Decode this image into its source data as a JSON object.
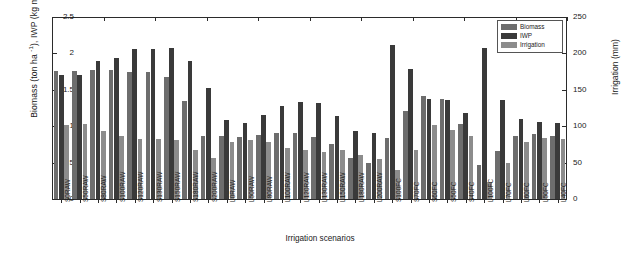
{
  "chart_data": {
    "type": "bar",
    "title": "",
    "xlabel": "Irrigation scenarios",
    "ylabel_left": "Biomass (ton ha -1), IWP (kg m -3)",
    "ylabel_right": "Irrigation (mm)",
    "ylim_left": [
      0,
      2.5
    ],
    "ylim_right": [
      0,
      250
    ],
    "yticks_left": [
      "0",
      "0.5",
      "1",
      "1.5",
      "2",
      "2.5"
    ],
    "yticks_left_values": [
      0,
      0.5,
      1,
      1.5,
      2,
      2.5
    ],
    "yticks_right": [
      "0",
      "50",
      "100",
      "150",
      "200",
      "250"
    ],
    "yticks_right_values": [
      0,
      50,
      100,
      150,
      200,
      250
    ],
    "grid": false,
    "legend_position": "top-right",
    "categories": [
      "S0RAW",
      "S50RAW",
      "S80RAW",
      "S100RAW",
      "S120RAW",
      "S130RAW",
      "S150RAW",
      "S180RAW",
      "S200RAW",
      "L0RAW",
      "L50RAW",
      "L80RAW",
      "L100RAW",
      "L120RAW",
      "L130RAW",
      "L150RAW",
      "L180RAW",
      "L200RAW",
      "S100FC",
      "S70FC",
      "S60FC",
      "S50FC",
      "S40FC",
      "L100FC",
      "L70FC",
      "L60FC",
      "L50FC",
      "L40FC"
    ],
    "series": [
      {
        "name": "Biomass",
        "axis": "left",
        "unit": "ton ha-1",
        "color": "#6d6d6d",
        "values": [
          1.76,
          1.76,
          1.77,
          1.77,
          1.75,
          1.74,
          1.68,
          1.35,
          0.86,
          0.86,
          0.85,
          0.88,
          0.9,
          0.91,
          0.85,
          0.76,
          0.56,
          0.5,
          0.84,
          1.21,
          1.41,
          1.38,
          1.03,
          0.47,
          0.66,
          0.87,
          0.89,
          0.86
        ]
      },
      {
        "name": "IWP",
        "axis": "left",
        "unit": "kg m-3",
        "color": "#3a3a3a",
        "values": [
          1.7,
          1.7,
          1.9,
          1.94,
          2.06,
          2.06,
          2.07,
          1.9,
          1.53,
          1.08,
          1.05,
          1.15,
          1.28,
          1.33,
          1.32,
          1.14,
          0.94,
          0.9,
          2.12,
          1.78,
          1.38,
          1.36,
          1.18,
          2.08,
          1.36,
          1.1,
          1.06,
          1.05
        ]
      },
      {
        "name": "Irrigation",
        "axis": "right",
        "unit": "mm",
        "color": "#8c8c8c",
        "values": [
          102,
          103,
          93,
          87,
          83,
          83,
          81,
          68,
          56,
          79,
          81,
          79,
          70,
          68,
          64,
          67,
          61,
          55,
          40,
          68,
          102,
          95,
          87,
          23,
          49,
          79,
          84,
          82
        ]
      }
    ]
  },
  "legend": {
    "items": [
      {
        "label": "Biomass",
        "color": "#6d6d6d"
      },
      {
        "label": "IWP",
        "color": "#3a3a3a"
      },
      {
        "label": "Irrigation",
        "color": "#8c8c8c"
      }
    ]
  }
}
